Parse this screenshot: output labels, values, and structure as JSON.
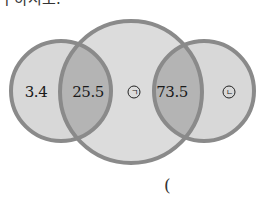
{
  "question_fragment": "구하시오.",
  "venn": {
    "colors": {
      "fill": "#d8d8d8",
      "overlap": "#b4b4b4",
      "stroke": "#8a8a8a"
    },
    "circles": [
      {
        "name": "left",
        "cx": 61,
        "cy": 91,
        "r": 50
      },
      {
        "name": "middle",
        "cx": 131,
        "cy": 92,
        "r": 71
      },
      {
        "name": "right",
        "cx": 204,
        "cy": 91,
        "r": 50
      }
    ],
    "regions": {
      "left_only": "3.4",
      "left_middle_overlap": "25.5",
      "middle_only": "ㄱ",
      "middle_right_overlap": "73.5",
      "right_only": "ㄴ"
    }
  },
  "answer": {
    "open_paren": "("
  }
}
